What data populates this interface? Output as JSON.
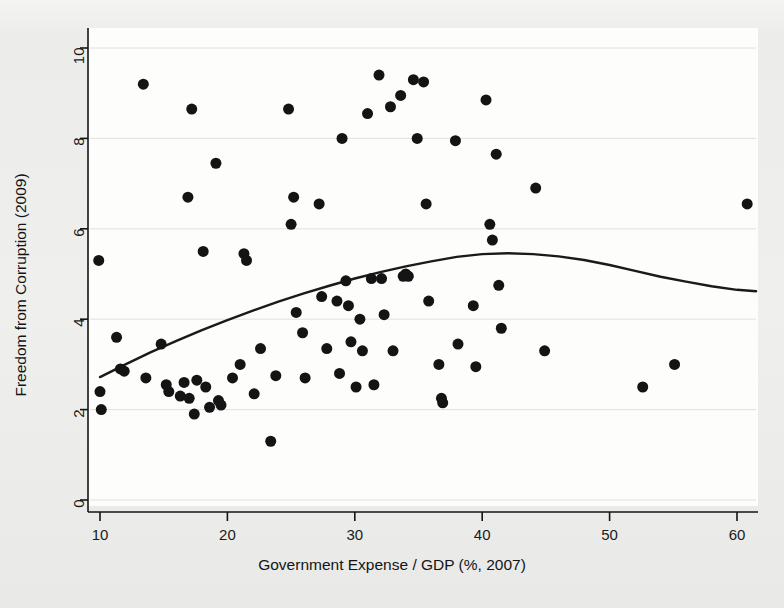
{
  "figure": {
    "background_color": "#eeeeec",
    "panel_color": "#fdfdfc",
    "ink_color": "#141414",
    "grid_color": "#e0e0de"
  },
  "chart_data": {
    "type": "scatter",
    "title": "",
    "xlabel": "Government Expense / GDP (%, 2007)",
    "ylabel": "Freedom from Corruption (2009)",
    "xlim": [
      8.6,
      62.8
    ],
    "ylim": [
      -0.35,
      10.5
    ],
    "xticks": [
      10,
      20,
      30,
      40,
      50,
      60
    ],
    "yticks": [
      0,
      2,
      4,
      6,
      8,
      10
    ],
    "xtick_labels": [
      "10",
      "20",
      "30",
      "40",
      "50",
      "60"
    ],
    "ytick_labels": [
      "0",
      "2",
      "4",
      "6",
      "8",
      "10"
    ],
    "grid": "horizontal-only",
    "grid_at": [
      0,
      2,
      4,
      6,
      8,
      10
    ],
    "legend": "none",
    "marker": {
      "shape": "circle",
      "color": "#141414",
      "size_px": 11
    },
    "points": [
      [
        9.9,
        5.3
      ],
      [
        10.0,
        2.4
      ],
      [
        10.1,
        2.0
      ],
      [
        11.3,
        3.6
      ],
      [
        11.6,
        2.9
      ],
      [
        11.9,
        2.85
      ],
      [
        13.4,
        9.2
      ],
      [
        13.6,
        2.7
      ],
      [
        14.8,
        3.45
      ],
      [
        15.2,
        2.55
      ],
      [
        15.4,
        2.4
      ],
      [
        16.3,
        2.3
      ],
      [
        16.6,
        2.6
      ],
      [
        16.9,
        6.7
      ],
      [
        17.0,
        2.25
      ],
      [
        17.2,
        8.65
      ],
      [
        17.4,
        1.9
      ],
      [
        17.6,
        2.65
      ],
      [
        18.1,
        5.5
      ],
      [
        18.3,
        2.5
      ],
      [
        18.6,
        2.05
      ],
      [
        19.1,
        7.45
      ],
      [
        19.3,
        2.2
      ],
      [
        19.5,
        2.1
      ],
      [
        20.4,
        2.7
      ],
      [
        21.0,
        3.0
      ],
      [
        21.3,
        5.45
      ],
      [
        21.5,
        5.3
      ],
      [
        22.1,
        2.35
      ],
      [
        22.6,
        3.35
      ],
      [
        23.4,
        1.3
      ],
      [
        23.8,
        2.75
      ],
      [
        24.8,
        8.65
      ],
      [
        25.0,
        6.1
      ],
      [
        25.2,
        6.7
      ],
      [
        25.4,
        4.15
      ],
      [
        25.9,
        3.7
      ],
      [
        26.1,
        2.7
      ],
      [
        27.2,
        6.55
      ],
      [
        27.4,
        4.5
      ],
      [
        27.8,
        3.35
      ],
      [
        28.6,
        4.4
      ],
      [
        28.8,
        2.8
      ],
      [
        29.0,
        8.0
      ],
      [
        29.3,
        4.85
      ],
      [
        29.5,
        4.3
      ],
      [
        29.7,
        3.5
      ],
      [
        30.1,
        2.5
      ],
      [
        30.4,
        4.0
      ],
      [
        30.6,
        3.3
      ],
      [
        31.0,
        8.55
      ],
      [
        31.3,
        4.9
      ],
      [
        31.5,
        2.55
      ],
      [
        31.9,
        9.4
      ],
      [
        32.1,
        4.9
      ],
      [
        32.3,
        4.1
      ],
      [
        32.8,
        8.7
      ],
      [
        33.0,
        3.3
      ],
      [
        33.6,
        8.95
      ],
      [
        33.8,
        4.95
      ],
      [
        34.0,
        5.0
      ],
      [
        34.2,
        4.95
      ],
      [
        34.6,
        9.3
      ],
      [
        34.9,
        8.0
      ],
      [
        35.4,
        9.25
      ],
      [
        35.6,
        6.55
      ],
      [
        35.8,
        4.4
      ],
      [
        36.6,
        3.0
      ],
      [
        36.8,
        2.25
      ],
      [
        36.9,
        2.15
      ],
      [
        37.9,
        7.95
      ],
      [
        38.1,
        3.45
      ],
      [
        39.3,
        4.3
      ],
      [
        39.5,
        2.95
      ],
      [
        40.3,
        8.85
      ],
      [
        40.6,
        6.1
      ],
      [
        40.8,
        5.75
      ],
      [
        41.1,
        7.65
      ],
      [
        41.3,
        4.75
      ],
      [
        41.5,
        3.8
      ],
      [
        44.2,
        6.9
      ],
      [
        44.9,
        3.3
      ],
      [
        52.6,
        2.5
      ],
      [
        55.1,
        3.0
      ],
      [
        60.8,
        6.55
      ]
    ],
    "fit_curve": {
      "label": "quadratic fit",
      "color": "#1a1a1a",
      "width_px": 2.4,
      "x": [
        10,
        12,
        14,
        16,
        18,
        20,
        22,
        24,
        26,
        28,
        30,
        32,
        34,
        36,
        38,
        40,
        42,
        44,
        46,
        48,
        50,
        52,
        54,
        56,
        58,
        60,
        61.5
      ],
      "y": [
        2.72,
        3.0,
        3.27,
        3.52,
        3.76,
        3.98,
        4.19,
        4.39,
        4.57,
        4.74,
        4.9,
        5.04,
        5.17,
        5.28,
        5.38,
        5.44,
        5.46,
        5.44,
        5.39,
        5.31,
        5.2,
        5.07,
        4.94,
        4.83,
        4.73,
        4.65,
        4.62
      ]
    }
  }
}
